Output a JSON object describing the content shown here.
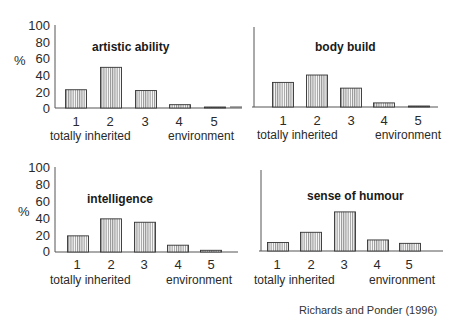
{
  "chart_data": [
    {
      "type": "bar",
      "title": "artistic ability",
      "categories": [
        "1",
        "2",
        "3",
        "4",
        "5"
      ],
      "values": [
        22,
        49,
        21,
        4,
        0.5
      ],
      "xlabel_left": "totally inherited",
      "xlabel_right": "environment",
      "ylabel": "%",
      "yticks": [
        "100",
        "80",
        "60",
        "40",
        "20",
        "0"
      ],
      "ylim": [
        0,
        100
      ],
      "grid": false
    },
    {
      "type": "bar",
      "title": "body build",
      "categories": [
        "1",
        "2",
        "3",
        "4",
        "5"
      ],
      "values": [
        30,
        39,
        23,
        5,
        0.5
      ],
      "xlabel_left": "totally inherited",
      "xlabel_right": "environment",
      "ylabel": "%",
      "ylim": [
        0,
        100
      ],
      "grid": false
    },
    {
      "type": "bar",
      "title": "intelligence",
      "categories": [
        "1",
        "2",
        "3",
        "4",
        "5"
      ],
      "values": [
        19,
        39,
        35,
        8,
        2
      ],
      "xlabel_left": "totally inherited",
      "xlabel_right": "environment",
      "ylabel": "%",
      "yticks": [
        "100",
        "80",
        "60",
        "40",
        "20",
        "0"
      ],
      "ylim": [
        0,
        100
      ],
      "grid": false
    },
    {
      "type": "bar",
      "title": "sense of humour",
      "categories": [
        "1",
        "2",
        "3",
        "4",
        "5"
      ],
      "values": [
        10,
        22,
        46,
        13,
        9
      ],
      "xlabel_left": "totally inherited",
      "xlabel_right": "environment",
      "ylabel": "%",
      "ylim": [
        0,
        100
      ],
      "grid": false
    }
  ],
  "panels": [
    {
      "title": "artistic ability"
    },
    {
      "title": "body build"
    },
    {
      "title": "intelligence"
    },
    {
      "title": "sense of humour"
    }
  ],
  "axis": {
    "ylabel": "%",
    "yticks": [
      "100",
      "80",
      "60",
      "40",
      "20",
      "0"
    ],
    "categories": [
      "1",
      "2",
      "3",
      "4",
      "5"
    ],
    "left_end_label": "totally inherited",
    "right_end_label": "environment"
  },
  "citation": "Richards and Ponder (1996)",
  "colors": {
    "bar_stroke": "#333333",
    "bar_hatch": "#555555",
    "axis": "#555555",
    "text": "#2a2a2a"
  }
}
